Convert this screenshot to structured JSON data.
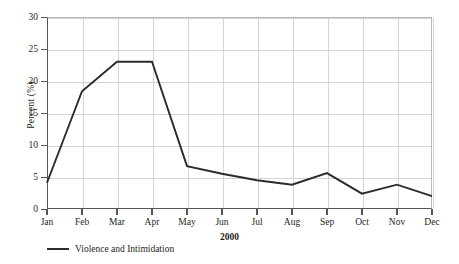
{
  "chart_data": {
    "type": "line",
    "title": "",
    "xlabel": "2000",
    "ylabel": "Percent (%)",
    "categories": [
      "Jan",
      "Feb",
      "Mar",
      "Apr",
      "May",
      "Jun",
      "Jul",
      "Aug",
      "Sep",
      "Oct",
      "Nov",
      "Dec"
    ],
    "series": [
      {
        "name": "Violence and Intimidation",
        "color": "#2b2b2b",
        "values": [
          4.1,
          18.4,
          23.0,
          23.0,
          6.7,
          5.5,
          4.5,
          3.8,
          5.6,
          2.4,
          3.8,
          2.0
        ]
      }
    ],
    "ylim": [
      0,
      30
    ],
    "yticks": [
      0,
      5,
      10,
      15,
      20,
      25,
      30
    ],
    "ytick_labels": [
      "0",
      "5",
      "10",
      "15",
      "20",
      "25",
      "30"
    ],
    "grid": true,
    "legend_position": "below-left"
  },
  "legend": {
    "entries": [
      {
        "label": "Violence and Intimidation",
        "color": "#2b2b2b"
      }
    ]
  },
  "axes": {
    "y_title": "Percent (%)",
    "x_title": "2000"
  }
}
